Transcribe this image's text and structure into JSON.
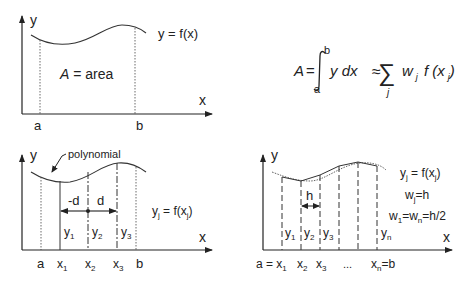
{
  "panel_top_left": {
    "y_axis": "y",
    "x_axis": "x",
    "curve_label": "y = f(x)",
    "area_label_italic": "A",
    "area_label_rest": " = area",
    "a": "a",
    "b": "b"
  },
  "formula": {
    "lhs": "A",
    "eq": "=",
    "upper": "b",
    "lower": "a",
    "integrand": "y dx",
    "approx": "≈",
    "sum_index": "j",
    "w": "w",
    "w_sub": "j",
    "f": "f (x",
    "x_sub": "j",
    "close": ")"
  },
  "panel_bottom_left": {
    "y_axis": "y",
    "x_axis": "x",
    "poly_label": "polynomial",
    "minus_d": "-d",
    "d": "d",
    "eq_y": "y",
    "eq_sub1": "j",
    "eq_mid": " = f(x",
    "eq_sub2": "j",
    "eq_close": ")",
    "ordinates": [
      {
        "name": "y",
        "sub": "1"
      },
      {
        "name": "y",
        "sub": "2"
      },
      {
        "name": "y",
        "sub": "3"
      }
    ],
    "ticks": [
      {
        "name": "a",
        "sub": ""
      },
      {
        "name": "x",
        "sub": "1"
      },
      {
        "name": "x",
        "sub": "2"
      },
      {
        "name": "x",
        "sub": "3"
      },
      {
        "name": "b",
        "sub": ""
      }
    ]
  },
  "panel_bottom_right": {
    "y_axis": "y",
    "x_axis": "x",
    "h": "h",
    "eq1_y": "y",
    "eq1_sub": "j",
    "eq1_mid": " = f(x",
    "eq1_sub2": "j",
    "eq1_close": ")",
    "eq2_w": "w",
    "eq2_sub": "j",
    "eq2_rest": "=h",
    "eq3_w1": "w",
    "eq3_sub1": "1",
    "eq3_eq": "=w",
    "eq3_subn": "n",
    "eq3_rest": "=h/2",
    "ordinates": [
      {
        "name": "y",
        "sub": "1"
      },
      {
        "name": "y",
        "sub": "2"
      },
      {
        "name": "y",
        "sub": "3"
      },
      {
        "name": "y",
        "sub": "n"
      }
    ],
    "tick_a_eq": "a = x",
    "tick_a_sub": "1",
    "tick_x2": "x",
    "tick_x2_sub": "2",
    "tick_x3": "x",
    "tick_x3_sub": "3",
    "tick_dots": "...",
    "tick_xn": "x",
    "tick_xn_sub": "n",
    "tick_xn_rest": "=b"
  }
}
